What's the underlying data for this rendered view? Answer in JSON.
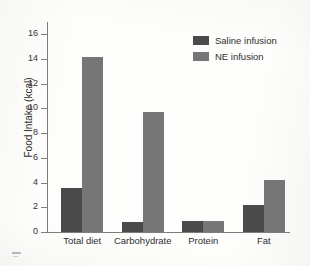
{
  "chart_data": {
    "type": "bar",
    "title": "",
    "xlabel": "",
    "ylabel": "Food Intake (kcal)",
    "categories": [
      "Total diet",
      "Carbohydrate",
      "Protein",
      "Fat"
    ],
    "series": [
      {
        "name": "Saline infusion",
        "color": "#4a4a4a",
        "values": [
          3.6,
          0.8,
          0.9,
          2.2
        ]
      },
      {
        "name": "NE infusion",
        "color": "#767676",
        "values": [
          14.2,
          9.7,
          0.9,
          4.2
        ]
      }
    ],
    "ylim": [
      0,
      17
    ],
    "yticks": [
      0,
      2,
      4,
      6,
      8,
      10,
      12,
      14,
      16
    ],
    "ytick_labels": [
      "0",
      "2",
      "4",
      "6",
      "8",
      "10",
      "12",
      "14",
      "16"
    ],
    "grid": false,
    "legend_position": "top-right",
    "axis_color": "#7d7d7d",
    "background_color": "#fdfdfc"
  },
  "legend": {
    "entries": [
      {
        "label": "Saline infusion",
        "swatch": "legend-swatch-saline"
      },
      {
        "label": "NE infusion",
        "swatch": "legend-swatch-ne"
      }
    ]
  },
  "axes": {
    "y_title": "Food Intake (kcal)"
  }
}
